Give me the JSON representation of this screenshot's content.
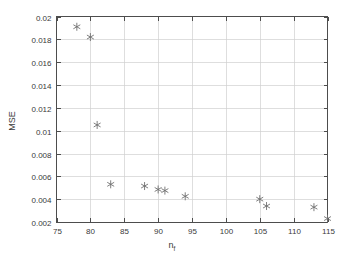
{
  "chart_data": {
    "type": "scatter",
    "title": "",
    "xlabel": "n_f",
    "xlabel_base": "n",
    "xlabel_sub": "f",
    "ylabel": "MSE",
    "xlim": [
      75,
      115
    ],
    "ylim": [
      0.002,
      0.02
    ],
    "grid": true,
    "legend": null,
    "marker": "asterisk",
    "marker_color": "#707070",
    "xticks": [
      75,
      80,
      85,
      90,
      95,
      100,
      105,
      110,
      115
    ],
    "xtick_labels": [
      "75",
      "80",
      "85",
      "90",
      "95",
      "100",
      "105",
      "110",
      "115"
    ],
    "yticks": [
      0.002,
      0.004,
      0.006,
      0.008,
      0.01,
      0.012,
      0.014,
      0.016,
      0.018,
      0.02
    ],
    "ytick_labels": [
      "0.002",
      "0.004",
      "0.006",
      "0.008",
      "0.01",
      "0.012",
      "0.014",
      "0.016",
      "0.018",
      "0.02"
    ],
    "x": [
      78,
      80,
      81,
      83,
      88,
      90,
      91,
      94,
      105,
      106,
      113,
      115
    ],
    "y": [
      0.0191,
      0.0182,
      0.0105,
      0.0053,
      0.00515,
      0.00485,
      0.00475,
      0.00425,
      0.004,
      0.0034,
      0.0033,
      0.0023
    ],
    "points": [
      {
        "x": 78,
        "y": 0.0191
      },
      {
        "x": 80,
        "y": 0.0182
      },
      {
        "x": 81,
        "y": 0.0105
      },
      {
        "x": 83,
        "y": 0.0053
      },
      {
        "x": 88,
        "y": 0.00515
      },
      {
        "x": 90,
        "y": 0.00485
      },
      {
        "x": 91,
        "y": 0.00475
      },
      {
        "x": 94,
        "y": 0.00425
      },
      {
        "x": 105,
        "y": 0.004
      },
      {
        "x": 106,
        "y": 0.0034
      },
      {
        "x": 113,
        "y": 0.0033
      },
      {
        "x": 115,
        "y": 0.0023
      }
    ]
  },
  "colors": {
    "background": "#ffffff",
    "axis": "#4d4d4d",
    "grid": "#d0d0d0",
    "text": "#3a3a3a",
    "marker": "#707070"
  }
}
